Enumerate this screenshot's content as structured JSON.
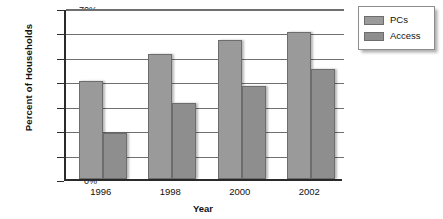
{
  "chart_data": {
    "type": "bar",
    "title": "",
    "xlabel": "Year",
    "ylabel": "Percent of Households",
    "categories": [
      "1996",
      "1998",
      "2000",
      "2002"
    ],
    "series": [
      {
        "name": "PCs",
        "values": [
          40,
          51,
          57,
          60
        ],
        "color": "#9a9a9a"
      },
      {
        "name": "Access",
        "values": [
          19,
          31,
          38,
          45
        ],
        "color": "#8e8e8e"
      }
    ],
    "ylim": [
      0,
      70
    ],
    "ytick_labels": [
      "0%",
      "10%",
      "20%",
      "30%",
      "40%",
      "50%",
      "60%",
      "70%"
    ],
    "ytick_values": [
      0,
      10,
      20,
      30,
      40,
      50,
      60,
      70
    ],
    "grid": true,
    "legend_position": "top-right"
  },
  "legend": {
    "items": [
      {
        "label": "PCs"
      },
      {
        "label": "Access"
      }
    ]
  },
  "axes": {
    "y_title": "Percent of Households",
    "x_title": "Year"
  }
}
